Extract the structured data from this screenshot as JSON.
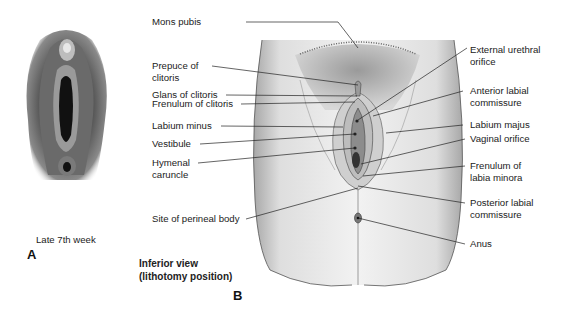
{
  "panel_a": {
    "letter": "A",
    "caption": "Late 7th week"
  },
  "panel_b": {
    "letter": "B",
    "view_line1": "Inferior view",
    "view_line2": "(lithotomy position)",
    "left_labels": [
      {
        "line1": "Mons pubis",
        "line2": ""
      },
      {
        "line1": "Prepuce of",
        "line2": "clitoris"
      },
      {
        "line1": "Glans of clitoris",
        "line2": ""
      },
      {
        "line1": "Frenulum of clitoris",
        "line2": ""
      },
      {
        "line1": "Labium minus",
        "line2": ""
      },
      {
        "line1": "Vestibule",
        "line2": ""
      },
      {
        "line1": "Hymenal",
        "line2": "caruncle"
      },
      {
        "line1": "Site of perineal body",
        "line2": ""
      }
    ],
    "right_labels": [
      {
        "line1": "External urethral",
        "line2": "orifice"
      },
      {
        "line1": "Anterior labial",
        "line2": "commissure"
      },
      {
        "line1": "Labium majus",
        "line2": ""
      },
      {
        "line1": "Vaginal orifice",
        "line2": ""
      },
      {
        "line1": "Frenulum of",
        "line2": "labia minora"
      },
      {
        "line1": "Posterior labial",
        "line2": "commissure"
      },
      {
        "line1": "Anus",
        "line2": ""
      }
    ]
  }
}
